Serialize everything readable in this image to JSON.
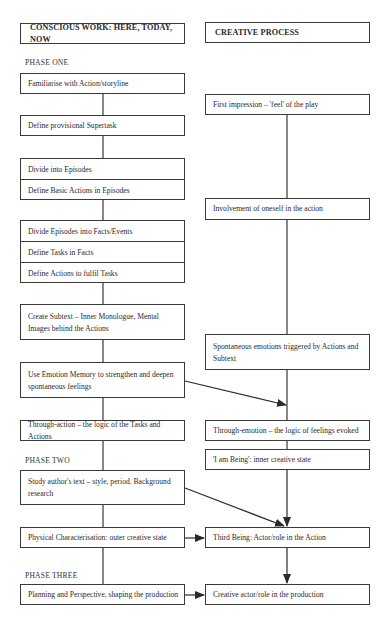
{
  "columns": {
    "left_header": "CONSCIOUS WORK: HERE, TODAY, NOW",
    "right_header": "CREATIVE PROCESS"
  },
  "phases": {
    "one": "PHASE ONE",
    "two": "PHASE TWO",
    "three": "PHASE THREE"
  },
  "left": {
    "familiarise": "Familiarise with Action/storyline",
    "supertask": "Define provisional Supertask",
    "episodes": [
      "Divide into Episodes",
      "Define Basic Actions in Episodes"
    ],
    "facts": [
      "Divide Episodes into Facts/Events",
      "Define Tasks in Facts",
      "Define Actions to fulfil Tasks"
    ],
    "subtext": "Create Subtext – Inner Monologue, Mental Images behind the Actions",
    "emotion_memory": "Use Emotion Memory to strengthen and deepen spontaneous feelings",
    "through_action": "Through-action – the logic of the Tasks and Actions",
    "study": "Study author's text – style, period. Background research",
    "physical": "Physical Characterisation: outer creative state",
    "planning": "Planning and Perspective, shaping the production"
  },
  "right": {
    "first_impression": "First impression – 'feel' of the play",
    "involvement": "Involvement of oneself in the action",
    "spontaneous": "Spontaneous emotions triggered by Actions and Subtext",
    "through_emotion": "Through-emotion – the logic of feelings evoked",
    "i_am_being": "'I am Being': inner creative state",
    "third_being": "Third Being: Actor/role in the Action",
    "creative_actor": "Creative actor/role in the production"
  },
  "colors": {
    "line": "#3a3a3a",
    "text": "#2a2a2a",
    "background": "#ffffff"
  }
}
